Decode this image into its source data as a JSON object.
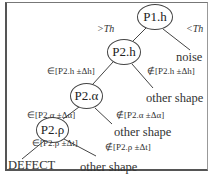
{
  "diagram": {
    "type": "decision-tree",
    "nodes": {
      "root": "P1.h",
      "n2": "P2.h",
      "n3": "P2.α",
      "n4": "P2.ρ"
    },
    "edges": {
      "root_left": ">Th",
      "root_right": "<Th",
      "n2_left": "∈[P2.h ±Δh]",
      "n2_right": "∉[P2.h ±Δh]",
      "n3_left": "∈[P2.α ±Δα]",
      "n3_right": "∉[P2.α ±Δα]",
      "n4_left": "∈[P2.ρ ±Δt]",
      "n4_right": "∉[P2.ρ ±Δt]"
    },
    "leaves": {
      "root_right": "noise",
      "n2_right": "other shape",
      "n3_right": "other shape",
      "n4_left": "DEFECT",
      "n4_right": "other shape"
    }
  }
}
